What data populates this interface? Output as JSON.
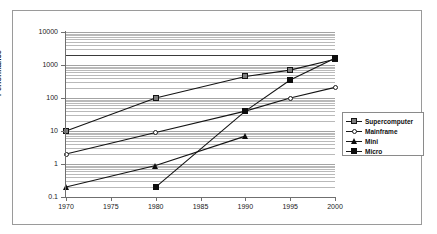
{
  "chart_data": {
    "type": "line",
    "title": "",
    "xlabel": "",
    "ylabel": "Performance",
    "x": [
      1970,
      1975,
      1980,
      1985,
      1990,
      1995,
      2000
    ],
    "xtick_labels": [
      "1970",
      "1975",
      "1980",
      "1985",
      "1990",
      "1995",
      "2000"
    ],
    "ytick_labels": [
      "0.1",
      "1",
      "10",
      "100",
      "1000",
      "10000"
    ],
    "ytick_values": [
      0.1,
      1,
      10,
      100,
      1000,
      10000
    ],
    "yscale": "log",
    "ylim": [
      0.1,
      10000
    ],
    "xlim": [
      1970,
      2000
    ],
    "grid": true,
    "grid_orientation": "horizontal",
    "legend_position": "right",
    "series": [
      {
        "name": "Supercomputer",
        "marker": "square-gray",
        "color": "#7d7d7d",
        "points": [
          {
            "x": 1970,
            "y": 10
          },
          {
            "x": 1980,
            "y": 100
          },
          {
            "x": 1990,
            "y": 450
          },
          {
            "x": 1995,
            "y": 700
          },
          {
            "x": 2000,
            "y": 1500
          }
        ]
      },
      {
        "name": "Mainframe",
        "marker": "diamond-open",
        "color": "#ffffff",
        "points": [
          {
            "x": 1970,
            "y": 2
          },
          {
            "x": 1980,
            "y": 9
          },
          {
            "x": 1990,
            "y": 40
          },
          {
            "x": 1995,
            "y": 100
          },
          {
            "x": 2000,
            "y": 210
          }
        ]
      },
      {
        "name": "Mini",
        "marker": "triangle-filled",
        "color": "#0d0d0d",
        "points": [
          {
            "x": 1970,
            "y": 0.2
          },
          {
            "x": 1980,
            "y": 0.9
          },
          {
            "x": 1990,
            "y": 7
          }
        ]
      },
      {
        "name": "Micro",
        "marker": "square-filled",
        "color": "#0d0d0d",
        "points": [
          {
            "x": 1980,
            "y": 0.2
          },
          {
            "x": 1990,
            "y": 40
          },
          {
            "x": 1995,
            "y": 350
          },
          {
            "x": 2000,
            "y": 1600
          }
        ]
      }
    ],
    "annotations": [
      {
        "type": "hline",
        "y": 2000,
        "color": "#3a3a3a"
      }
    ]
  },
  "legend": {
    "items": [
      {
        "label": "Supercomputer"
      },
      {
        "label": "Mainframe"
      },
      {
        "label": "Mini"
      },
      {
        "label": "Micro"
      }
    ]
  }
}
